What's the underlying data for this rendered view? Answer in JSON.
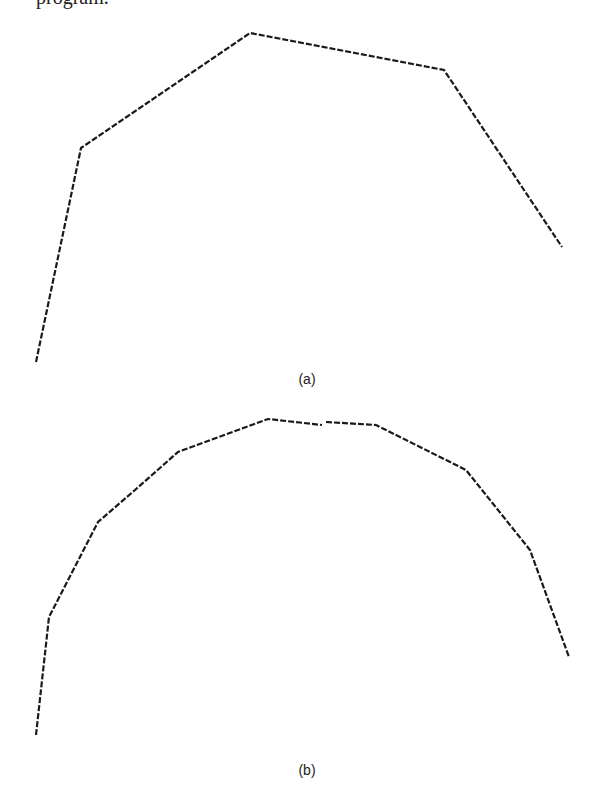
{
  "header_fragment": "program.",
  "figures": [
    {
      "label": "(a)",
      "points": [
        [
          36,
          362
        ],
        [
          81,
          148
        ],
        [
          250,
          33
        ],
        [
          444,
          70
        ],
        [
          562,
          247
        ]
      ]
    },
    {
      "label": "(b)",
      "points_left": [
        [
          36,
          735
        ],
        [
          49,
          617
        ],
        [
          98,
          522
        ],
        [
          135,
          490
        ],
        [
          178,
          452
        ],
        [
          268,
          419
        ],
        [
          322,
          425
        ]
      ],
      "points_right": [
        [
          326,
          422
        ],
        [
          376,
          425
        ],
        [
          466,
          470
        ],
        [
          530,
          550
        ],
        [
          569,
          657
        ]
      ]
    }
  ],
  "colors": {
    "line": "#1a1a1a",
    "background": "#ffffff"
  }
}
